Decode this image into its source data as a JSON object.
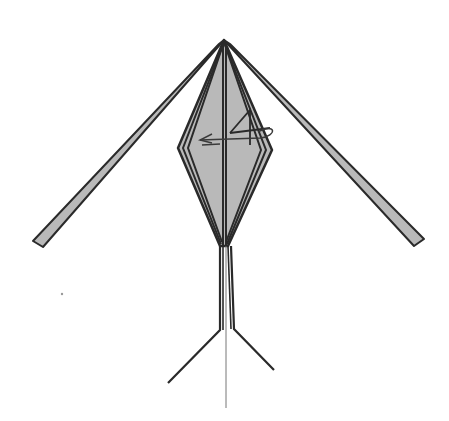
{
  "canvas": {
    "width": 449,
    "height": 421,
    "background": "#ffffff"
  },
  "colors": {
    "paper_fill": "#b9b9b9",
    "outline": "#2a2a2a",
    "thin_line": "#777777",
    "arrow": "#3a3a3a"
  },
  "diagram": {
    "apex": [
      224,
      40
    ],
    "left_wing": [
      [
        224,
        40
      ],
      [
        219,
        44
      ],
      [
        33,
        241
      ],
      [
        43,
        247
      ]
    ],
    "right_wing": [
      [
        224,
        40
      ],
      [
        230,
        44
      ],
      [
        424,
        239
      ],
      [
        414,
        246
      ]
    ],
    "body_outer": [
      [
        224,
        40
      ],
      [
        178,
        148
      ],
      [
        220,
        246
      ],
      [
        228,
        246
      ],
      [
        272,
        150
      ]
    ],
    "body_layers": [
      [
        [
          224,
          42
        ],
        [
          183,
          148
        ],
        [
          221,
          244
        ]
      ],
      [
        [
          224,
          42
        ],
        [
          188,
          148
        ],
        [
          222,
          242
        ]
      ],
      [
        [
          224,
          42
        ],
        [
          266,
          150
        ],
        [
          227,
          244
        ]
      ],
      [
        [
          224,
          42
        ],
        [
          261,
          150
        ],
        [
          226,
          242
        ]
      ]
    ],
    "center_lines": [
      [
        [
          223,
          44
        ],
        [
          223,
          246
        ]
      ],
      [
        [
          226,
          44
        ],
        [
          226,
          246
        ]
      ]
    ],
    "legs": {
      "left": [
        [
          220,
          246
        ],
        [
          220,
          330
        ],
        [
          168,
          383
        ]
      ],
      "left_inner": [
        [
          223,
          246
        ],
        [
          223,
          330
        ]
      ],
      "right": [
        [
          231,
          246
        ],
        [
          234,
          329
        ],
        [
          274,
          370
        ]
      ],
      "right_inner": [
        [
          228,
          246
        ],
        [
          231,
          329
        ]
      ]
    },
    "center_string": [
      [
        226,
        246
      ],
      [
        226,
        408
      ]
    ],
    "fold_marks": [
      [
        [
          230,
          133
        ],
        [
          250,
          110
        ],
        [
          250,
          145
        ]
      ],
      [
        [
          230,
          133
        ],
        [
          270,
          128
        ]
      ]
    ],
    "arrow": {
      "type": "fold-behind / turn-over arrow",
      "direction": "left",
      "shaft": [
        [
          258,
          132
        ],
        [
          200,
          140
        ]
      ],
      "head_at": [
        200,
        140
      ],
      "loop_center": [
        256,
        128
      ]
    },
    "speck": [
      62,
      294
    ]
  }
}
